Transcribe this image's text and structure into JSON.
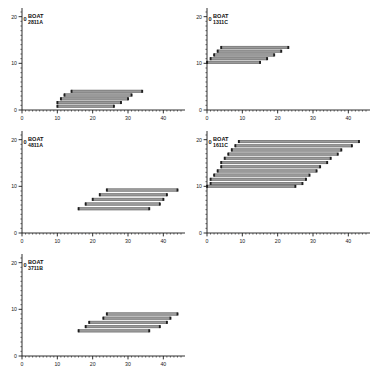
{
  "figure": {
    "background_color": "#ffffff",
    "bar_fill_color": "#9a9a9a",
    "bar_edge_color": "#4a4a4a",
    "marker_color": "#1e1e1e",
    "axis_color": "#1a1a1a",
    "layout": "2-column grid, 5 panels (bottom-right empty)"
  },
  "chart_data": [
    {
      "type": "bar",
      "orientation": "horizontal",
      "title": "BOAT",
      "id_label": "2811A",
      "zero_label": "0",
      "xlabel": "",
      "ylabel": "",
      "xlim": [
        0,
        45
      ],
      "ylim": [
        0,
        21
      ],
      "xticks": [
        0,
        10,
        20,
        30,
        40
      ],
      "yticks": [
        0,
        10,
        20
      ],
      "xticklabels": [
        "0",
        "10",
        "20",
        "30",
        "40"
      ],
      "yticklabels": [
        "0",
        "10",
        "20"
      ],
      "grid": false,
      "legend": "none",
      "intervals": [
        {
          "y": 4.0,
          "start": 14,
          "end": 34
        },
        {
          "y": 3.2,
          "start": 12,
          "end": 31
        },
        {
          "y": 2.4,
          "start": 11,
          "end": 30
        },
        {
          "y": 1.6,
          "start": 10,
          "end": 28
        },
        {
          "y": 0.8,
          "start": 10,
          "end": 26
        }
      ]
    },
    {
      "type": "bar",
      "orientation": "horizontal",
      "title": "BOAT",
      "id_label": "1311C",
      "zero_label": "0",
      "xlabel": "",
      "ylabel": "",
      "xlim": [
        0,
        45
      ],
      "ylim": [
        0,
        21
      ],
      "xticks": [
        0,
        10,
        20,
        30,
        40
      ],
      "yticks": [
        0,
        10,
        20
      ],
      "xticklabels": [
        "0",
        "10",
        "20",
        "30",
        "40"
      ],
      "yticklabels": [
        "0",
        "10",
        "20"
      ],
      "grid": false,
      "legend": "none",
      "intervals": [
        {
          "y": 13.4,
          "start": 4,
          "end": 23
        },
        {
          "y": 12.6,
          "start": 3,
          "end": 21
        },
        {
          "y": 11.8,
          "start": 2,
          "end": 19
        },
        {
          "y": 11.0,
          "start": 1,
          "end": 17
        },
        {
          "y": 10.2,
          "start": 0,
          "end": 15
        }
      ]
    },
    {
      "type": "bar",
      "orientation": "horizontal",
      "title": "BOAT",
      "id_label": "4811A",
      "zero_label": "0",
      "xlabel": "",
      "ylabel": "",
      "xlim": [
        0,
        45
      ],
      "ylim": [
        0,
        21
      ],
      "xticks": [
        0,
        10,
        20,
        30,
        40
      ],
      "yticks": [
        0,
        10,
        20
      ],
      "xticklabels": [
        "0",
        "10",
        "20",
        "30",
        "40"
      ],
      "yticklabels": [
        "0",
        "10",
        "20"
      ],
      "grid": false,
      "legend": "none",
      "intervals": [
        {
          "y": 9.2,
          "start": 24,
          "end": 44
        },
        {
          "y": 8.2,
          "start": 22,
          "end": 41
        },
        {
          "y": 7.2,
          "start": 20,
          "end": 40
        },
        {
          "y": 6.2,
          "start": 18,
          "end": 39
        },
        {
          "y": 5.2,
          "start": 16,
          "end": 36
        }
      ]
    },
    {
      "type": "bar",
      "orientation": "horizontal",
      "title": "BOAT",
      "id_label": "1611C",
      "zero_label": "0",
      "xlabel": "",
      "ylabel": "",
      "xlim": [
        0,
        45
      ],
      "ylim": [
        0,
        21
      ],
      "xticks": [
        0,
        10,
        20,
        30,
        40
      ],
      "yticks": [
        0,
        10,
        20
      ],
      "xticklabels": [
        "0",
        "10",
        "20",
        "30",
        "40"
      ],
      "yticklabels": [
        "0",
        "10",
        "20"
      ],
      "grid": false,
      "legend": "none",
      "intervals": [
        {
          "y": 19.6,
          "start": 9,
          "end": 43
        },
        {
          "y": 18.7,
          "start": 8,
          "end": 41
        },
        {
          "y": 17.8,
          "start": 7,
          "end": 38
        },
        {
          "y": 16.9,
          "start": 6,
          "end": 37
        },
        {
          "y": 16.0,
          "start": 5,
          "end": 35
        },
        {
          "y": 15.1,
          "start": 4,
          "end": 34
        },
        {
          "y": 14.2,
          "start": 4,
          "end": 32
        },
        {
          "y": 13.3,
          "start": 3,
          "end": 31
        },
        {
          "y": 12.4,
          "start": 2,
          "end": 29
        },
        {
          "y": 11.5,
          "start": 1,
          "end": 28
        },
        {
          "y": 10.6,
          "start": 1,
          "end": 27
        },
        {
          "y": 10.0,
          "start": 0,
          "end": 25
        }
      ]
    },
    {
      "type": "bar",
      "orientation": "horizontal",
      "title": "BOAT",
      "id_label": "3711B",
      "zero_label": "0",
      "xlabel": "",
      "ylabel": "",
      "xlim": [
        0,
        45
      ],
      "ylim": [
        0,
        21
      ],
      "xticks": [
        0,
        10,
        20,
        30,
        40
      ],
      "yticks": [
        0,
        10,
        20
      ],
      "xticklabels": [
        "0",
        "10",
        "20",
        "30",
        "40"
      ],
      "yticklabels": [
        "0",
        "10",
        "20"
      ],
      "grid": false,
      "legend": "none",
      "intervals": [
        {
          "y": 9.0,
          "start": 24,
          "end": 44
        },
        {
          "y": 8.1,
          "start": 23,
          "end": 42
        },
        {
          "y": 7.2,
          "start": 19,
          "end": 41
        },
        {
          "y": 6.3,
          "start": 18,
          "end": 39
        },
        {
          "y": 5.4,
          "start": 16,
          "end": 36
        }
      ]
    }
  ]
}
